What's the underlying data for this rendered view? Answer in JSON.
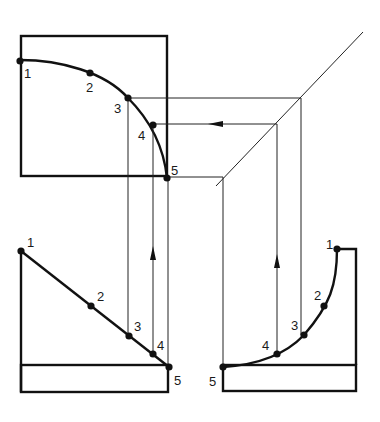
{
  "diagram": {
    "views": {
      "top_view": {
        "name": "curved profile view",
        "box": {
          "x": 21,
          "y": 36,
          "w": 146,
          "h": 140
        },
        "points": [
          {
            "label": "1",
            "x": 20,
            "y": 61,
            "lx": 24,
            "ly": 78
          },
          {
            "label": "2",
            "x": 90,
            "y": 73,
            "lx": 86,
            "ly": 92
          },
          {
            "label": "3",
            "x": 128,
            "y": 98,
            "lx": 114,
            "ly": 113
          },
          {
            "label": "4",
            "x": 153,
            "y": 125,
            "lx": 138,
            "ly": 140
          },
          {
            "label": "5",
            "x": 167,
            "y": 178,
            "lx": 171,
            "ly": 175
          }
        ]
      },
      "front_view": {
        "name": "inclined edge view",
        "points": [
          {
            "label": "1",
            "x": 21,
            "y": 251,
            "lx": 27,
            "ly": 247
          },
          {
            "label": "2",
            "x": 91,
            "y": 306,
            "lx": 97,
            "ly": 301
          },
          {
            "label": "3",
            "x": 129,
            "y": 336,
            "lx": 134,
            "ly": 331
          },
          {
            "label": "4",
            "x": 153,
            "y": 354,
            "lx": 157,
            "ly": 350
          },
          {
            "label": "5",
            "x": 169,
            "y": 367,
            "lx": 174,
            "ly": 385
          }
        ]
      },
      "side_view": {
        "name": "projected curve view",
        "points": [
          {
            "label": "1",
            "x": 337,
            "y": 249,
            "lx": 326,
            "ly": 249
          },
          {
            "label": "2",
            "x": 324,
            "y": 306,
            "lx": 314,
            "ly": 300
          },
          {
            "label": "3",
            "x": 304,
            "y": 335,
            "lx": 291,
            "ly": 330
          },
          {
            "label": "4",
            "x": 277,
            "y": 354,
            "lx": 262,
            "ly": 350
          },
          {
            "label": "5",
            "x": 223,
            "y": 367,
            "lx": 209,
            "ly": 386
          }
        ]
      }
    },
    "miter_line": {
      "x1": 216,
      "y1": 186,
      "x2": 363,
      "y2": 32
    },
    "colors": {
      "line": "#111111",
      "background": "#ffffff"
    }
  }
}
